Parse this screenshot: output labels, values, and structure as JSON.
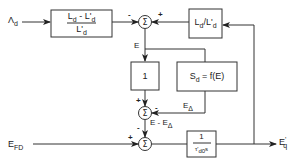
{
  "diagram": {
    "inputs": {
      "lambda_d": {
        "main": "Λ",
        "sub": "d"
      },
      "e_fd": {
        "main": "E",
        "sub": "FD"
      }
    },
    "output": {
      "main": "E",
      "sup": "'",
      "sub": "q"
    },
    "blocks": {
      "gain_block": {
        "num": "L_d - L'_d",
        "num_main1": "L",
        "num_sub1": "d",
        "num_mid": " - L'",
        "num_sub2": "d",
        "den_main": "L'",
        "den_sub": "d"
      },
      "ratio_block": {
        "main1": "L",
        "sub1": "d",
        "mid": "/L'",
        "sub2": "d"
      },
      "unity_block": {
        "value": "1"
      },
      "saturation_block": {
        "main": "S",
        "sub": "d",
        "rest": " = f(E)"
      },
      "integrator_block": {
        "num": "1",
        "den_main": "τ'",
        "den_sub": "d0",
        "den_s": "s"
      }
    },
    "summers": {
      "sum1": {
        "symbol": "Σ",
        "left_sign": "-",
        "right_sign": "+"
      },
      "sum2": {
        "symbol": "Σ",
        "top_sign": "+",
        "right_sign": "-"
      },
      "sum3": {
        "symbol": "Σ",
        "left_sign": "+",
        "top_sign": "-"
      }
    },
    "signals": {
      "e_label": "E",
      "e_delta": {
        "main": "E",
        "sub": "Δ"
      },
      "e_minus_e_delta": {
        "main": "E - E",
        "sub": "Δ"
      }
    }
  }
}
